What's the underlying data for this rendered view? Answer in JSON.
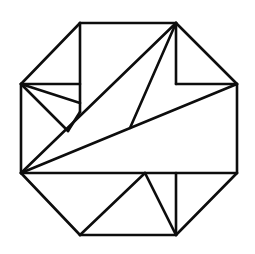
{
  "figure": {
    "kind": "line-drawing",
    "background_color": "#ffffff",
    "stroke_color": "#0d0d0d",
    "stroke_width": 2.6,
    "canvas": {
      "width": 255,
      "height": 254
    },
    "vertices": {
      "oct_top_left": [
        80,
        23
      ],
      "oct_top_right": [
        176,
        23
      ],
      "oct_right_top": [
        237,
        84
      ],
      "oct_right_bottom": [
        237,
        173
      ],
      "oct_bottom_right": [
        176,
        235
      ],
      "oct_bottom_left": [
        80,
        235
      ],
      "oct_left_bottom": [
        21,
        173
      ],
      "oct_left_top": [
        21,
        84
      ],
      "inner_v_top_mid": [
        80,
        112
      ],
      "inner_fan_mid": [
        80,
        103
      ],
      "inner_notch": [
        68,
        131
      ],
      "inner_center_join": [
        130,
        128
      ],
      "inner_bottom_apex": [
        145,
        173
      ]
    },
    "outline_segments": [
      {
        "name": "octagon-edge-top",
        "from": [
          80,
          23
        ],
        "to": [
          176,
          23
        ]
      },
      {
        "name": "octagon-edge-upper-right",
        "from": [
          176,
          23
        ],
        "to": [
          237,
          84
        ]
      },
      {
        "name": "octagon-edge-right",
        "from": [
          237,
          84
        ],
        "to": [
          237,
          173
        ]
      },
      {
        "name": "octagon-edge-lower-right",
        "from": [
          237,
          173
        ],
        "to": [
          176,
          235
        ]
      },
      {
        "name": "octagon-edge-bottom",
        "from": [
          176,
          235
        ],
        "to": [
          80,
          235
        ]
      },
      {
        "name": "octagon-edge-lower-left",
        "from": [
          80,
          235
        ],
        "to": [
          21,
          173
        ]
      },
      {
        "name": "octagon-edge-left",
        "from": [
          21,
          173
        ],
        "to": [
          21,
          84
        ]
      },
      {
        "name": "octagon-edge-upper-left",
        "from": [
          21,
          84
        ],
        "to": [
          80,
          23
        ]
      }
    ],
    "interior_segments": [
      {
        "name": "inner-vertical-upper-left",
        "from": [
          80,
          23
        ],
        "to": [
          80,
          112
        ]
      },
      {
        "name": "inner-horizontal-upper-left",
        "from": [
          21,
          84
        ],
        "to": [
          80,
          84
        ]
      },
      {
        "name": "inner-fan-upper",
        "from": [
          21,
          84
        ],
        "to": [
          80,
          103
        ]
      },
      {
        "name": "inner-fan-lower",
        "from": [
          21,
          84
        ],
        "to": [
          68,
          131
        ]
      },
      {
        "name": "inner-notch-to-vertical",
        "from": [
          68,
          131
        ],
        "to": [
          80,
          112
        ]
      },
      {
        "name": "inner-long-diagonal-main",
        "from": [
          21,
          173
        ],
        "to": [
          176,
          23
        ]
      },
      {
        "name": "inner-long-diagonal-lower",
        "from": [
          21,
          173
        ],
        "to": [
          237,
          84
        ]
      },
      {
        "name": "inner-diagonal-center-join",
        "from": [
          176,
          23
        ],
        "to": [
          130,
          128
        ]
      },
      {
        "name": "inner-vertical-upper-right",
        "from": [
          176,
          23
        ],
        "to": [
          176,
          84
        ]
      },
      {
        "name": "inner-horizontal-upper-right",
        "from": [
          176,
          84
        ],
        "to": [
          237,
          84
        ]
      },
      {
        "name": "inner-horizontal-lower",
        "from": [
          21,
          173
        ],
        "to": [
          237,
          173
        ]
      },
      {
        "name": "inner-bottom-left-diagonal",
        "from": [
          145,
          173
        ],
        "to": [
          80,
          235
        ]
      },
      {
        "name": "inner-bottom-right-diagonal",
        "from": [
          145,
          173
        ],
        "to": [
          176,
          235
        ]
      },
      {
        "name": "inner-vertical-lower-right",
        "from": [
          176,
          173
        ],
        "to": [
          176,
          235
        ]
      }
    ]
  }
}
